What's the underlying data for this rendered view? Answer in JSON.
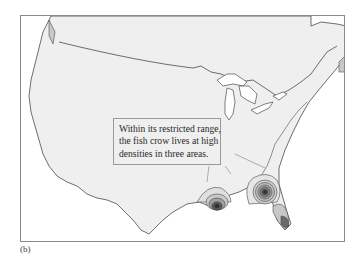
{
  "figure": {
    "panel_label": "(b)",
    "callout": {
      "lines": [
        "Within its restricted range,",
        "the fish crow lives at high",
        "densities in three areas."
      ]
    },
    "density_areas": [
      {
        "name": "Louisiana coast",
        "rings": 5
      },
      {
        "name": "Southern Georgia / Florida panhandle",
        "rings": 7
      },
      {
        "name": "South Florida",
        "rings": 2
      }
    ],
    "colors": {
      "land": "#efefef",
      "water": "#ffffff",
      "border": "#555555",
      "range_low": "#c8c8c8",
      "range_high": "#6a6a6a",
      "core": "#2e2e2e"
    }
  }
}
